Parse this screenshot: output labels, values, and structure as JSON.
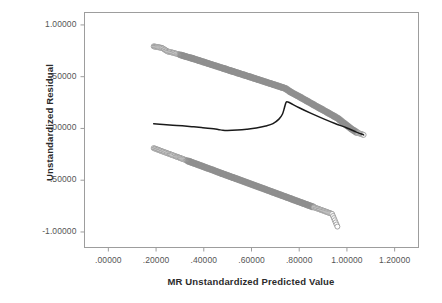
{
  "chart_data": {
    "type": "scatter",
    "title": "",
    "xlabel": "MR Unstandardized Predicted Value",
    "ylabel": "Unstandardized Residual",
    "xlim": [
      -0.1,
      1.3
    ],
    "ylim": [
      -1.15,
      1.12
    ],
    "xticks": [
      ".00000",
      ".20000",
      ".40000",
      ".60000",
      ".80000",
      "1.00000",
      "1.20000"
    ],
    "xtick_values": [
      0.0,
      0.2,
      0.4,
      0.6,
      0.8,
      1.0,
      1.2
    ],
    "yticks": [
      "1.00000",
      ".50000",
      ".00000",
      "-.50000",
      "-1.00000"
    ],
    "ytick_values": [
      1.0,
      0.5,
      0.0,
      -0.5,
      -1.0
    ],
    "grid": false,
    "legend": null,
    "frame": true,
    "marker": "open-circle",
    "marker_color": "#9a9a9a",
    "marker_fill": "#ffffff",
    "band_color": "#8f8f8f",
    "fit_line_color": "#1a1a1a",
    "series": [
      {
        "name": "upper-residual-band",
        "description": "Upper linear band of residuals, negative slope from (.19,.79) to (1.07,-.06)",
        "x": [
          0.19,
          0.206,
          0.225,
          0.248,
          0.265,
          0.278,
          0.292,
          0.305,
          0.318,
          0.332,
          0.346,
          0.36,
          0.375,
          0.39,
          0.406,
          0.422,
          0.438,
          0.455,
          0.472,
          0.49,
          0.508,
          0.526,
          0.545,
          0.564,
          0.583,
          0.602,
          0.622,
          0.642,
          0.662,
          0.682,
          0.702,
          0.722,
          0.742,
          0.762,
          0.782,
          0.802,
          0.822,
          0.842,
          0.862,
          0.882,
          0.902,
          0.922,
          0.942,
          0.962,
          0.982,
          1.002,
          1.022,
          1.042,
          1.07
        ],
        "y": [
          0.793,
          0.786,
          0.778,
          0.744,
          0.735,
          0.727,
          0.718,
          0.709,
          0.7,
          0.69,
          0.681,
          0.671,
          0.66,
          0.649,
          0.637,
          0.625,
          0.613,
          0.601,
          0.588,
          0.575,
          0.561,
          0.548,
          0.534,
          0.52,
          0.506,
          0.492,
          0.477,
          0.462,
          0.447,
          0.432,
          0.417,
          0.402,
          0.387,
          0.355,
          0.33,
          0.305,
          0.279,
          0.253,
          0.227,
          0.201,
          0.176,
          0.15,
          0.124,
          0.098,
          0.06,
          0.025,
          -0.01,
          -0.04,
          -0.062
        ]
      },
      {
        "name": "lower-residual-band",
        "description": "Lower linear band of residuals, negative slope from (.19,-.19) to (.96,-.95)",
        "x": [
          0.19,
          0.203,
          0.215,
          0.228,
          0.241,
          0.254,
          0.268,
          0.282,
          0.296,
          0.31,
          0.325,
          0.34,
          0.355,
          0.371,
          0.387,
          0.403,
          0.42,
          0.437,
          0.454,
          0.471,
          0.489,
          0.507,
          0.525,
          0.543,
          0.562,
          0.581,
          0.6,
          0.619,
          0.638,
          0.658,
          0.678,
          0.698,
          0.718,
          0.738,
          0.758,
          0.778,
          0.798,
          0.818,
          0.838,
          0.858,
          0.878,
          0.898,
          0.918,
          0.938,
          0.96
        ],
        "y": [
          -0.19,
          -0.201,
          -0.212,
          -0.223,
          -0.234,
          -0.245,
          -0.257,
          -0.269,
          -0.281,
          -0.293,
          -0.306,
          -0.319,
          -0.332,
          -0.345,
          -0.359,
          -0.373,
          -0.387,
          -0.401,
          -0.416,
          -0.431,
          -0.446,
          -0.461,
          -0.476,
          -0.491,
          -0.507,
          -0.523,
          -0.539,
          -0.555,
          -0.571,
          -0.588,
          -0.605,
          -0.622,
          -0.639,
          -0.656,
          -0.673,
          -0.69,
          -0.707,
          -0.724,
          -0.741,
          -0.758,
          -0.775,
          -0.792,
          -0.809,
          -0.826,
          -0.948
        ]
      },
      {
        "name": "loess-fit-curve",
        "description": "Black loess/lowess fit curve: flat near .045, dips to -.02 at x=.48, rises steeply at x=.74 to .26, then descends along the upper band to -.06",
        "x": [
          0.19,
          0.23,
          0.27,
          0.31,
          0.35,
          0.39,
          0.43,
          0.46,
          0.48,
          0.5,
          0.54,
          0.58,
          0.62,
          0.66,
          0.69,
          0.715,
          0.73,
          0.738,
          0.743,
          0.748,
          0.76,
          0.8,
          0.85,
          0.9,
          0.95,
          1.0,
          1.04,
          1.07
        ],
        "y": [
          0.045,
          0.039,
          0.032,
          0.025,
          0.017,
          0.009,
          0.0,
          -0.01,
          -0.018,
          -0.02,
          -0.016,
          -0.008,
          0.004,
          0.024,
          0.047,
          0.09,
          0.14,
          0.2,
          0.24,
          0.258,
          0.248,
          0.2,
          0.145,
          0.095,
          0.048,
          0.005,
          -0.035,
          -0.062
        ]
      }
    ]
  }
}
